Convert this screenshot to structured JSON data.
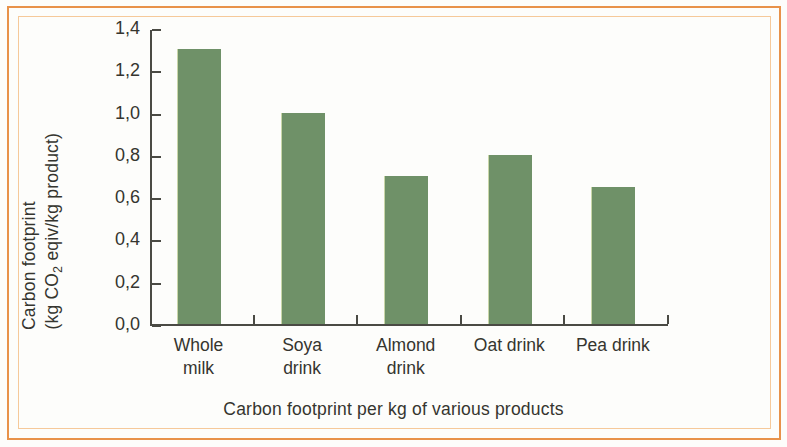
{
  "figure": {
    "caption": "Carbon footprint per kg of various products",
    "frame_color": "#e8924a",
    "bar_color": "#6f9168",
    "axis_color": "#4a4a44",
    "text_color": "#35352f"
  },
  "chart_data": {
    "type": "bar",
    "title": "",
    "subtitle": "",
    "caption": "Carbon footprint per kg of various products",
    "categories": [
      "Whole milk",
      "Soya drink",
      "Almond drink",
      "Oat drink",
      "Pea drink"
    ],
    "category_lines": [
      [
        "Whole",
        "milk"
      ],
      [
        "Soya",
        "drink"
      ],
      [
        "Almond",
        "drink"
      ],
      [
        "Oat drink"
      ],
      [
        "Pea drink"
      ]
    ],
    "values": [
      1.3,
      1.0,
      0.7,
      0.8,
      0.65
    ],
    "value_labels": [
      "1,3",
      "1,0",
      "0,7",
      "0,8",
      "0,65"
    ],
    "xlabel": "",
    "ylabel_line1": "Carbon footprint",
    "ylabel_line2_prefix": "(kg CO",
    "ylabel_line2_sub": "2",
    "ylabel_line2_suffix": " eqiv/kg product)",
    "ylabel_full": "Carbon footprint (kg CO2 eqiv/kg product)",
    "ylim": [
      0.0,
      1.4
    ],
    "ytick_values": [
      0.0,
      0.2,
      0.4,
      0.6,
      0.8,
      1.0,
      1.2,
      1.4
    ],
    "ytick_labels": [
      "0,0",
      "0,2",
      "0,4",
      "0,6",
      "0,8",
      "1,0",
      "1,2",
      "1,4"
    ],
    "decimal_separator": ",",
    "grid": false,
    "legend": false,
    "legend_position": "none",
    "series": [
      {
        "name": "Carbon footprint",
        "values": [
          1.3,
          1.0,
          0.7,
          0.8,
          0.65
        ]
      }
    ]
  }
}
